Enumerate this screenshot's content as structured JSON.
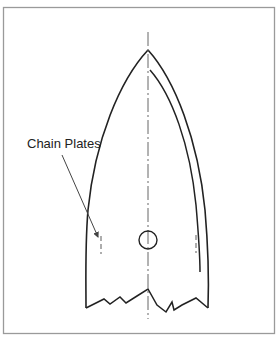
{
  "diagram": {
    "type": "hull-plan-view",
    "callout": {
      "label": "Chain Plates",
      "target": "chain-plate-port"
    },
    "colors": {
      "frame": "#9a9a9a",
      "outline": "#222222",
      "centerline": "#666666",
      "callout_line": "#444444",
      "chain_plate": "#777777"
    },
    "elements": [
      "frame-border",
      "hull-outline",
      "inner-sheer-line",
      "centerline",
      "mast-step-circle",
      "chain-plate-port",
      "chain-plate-starboard",
      "break-line",
      "chain-plates-callout"
    ]
  }
}
